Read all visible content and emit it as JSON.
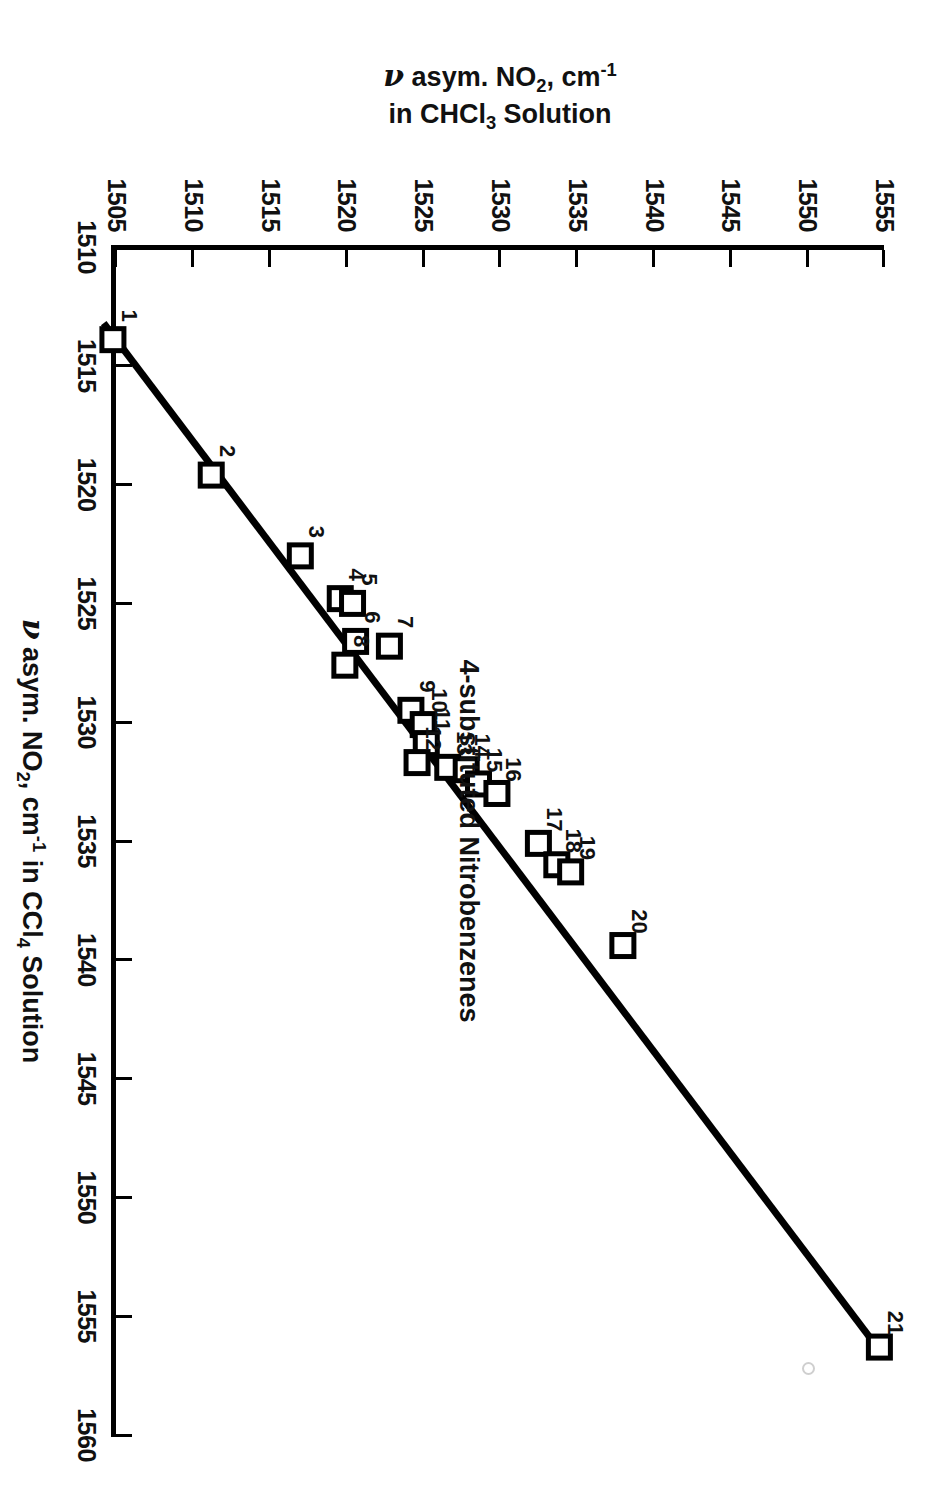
{
  "figure": {
    "annotation": "4-substituted Nitrobenzenes",
    "x_title_pre": "asym. NO",
    "x_title_sub": "2",
    "x_title_mid": ", cm",
    "x_title_sup": "-1",
    "x_title_post": " in CCl",
    "x_title_sub2": "4",
    "x_title_end": " Solution",
    "y_title_line1_pre": "asym. NO",
    "y_title_line1_sub": "2",
    "y_title_line1_mid": ", cm",
    "y_title_line1_sup": "-1",
    "y_title_line2_pre": "in CHCl",
    "y_title_line2_sub": "3",
    "y_title_line2_post": " Solution",
    "nu_glyph": "ν"
  },
  "chart_data": {
    "type": "scatter",
    "title": "",
    "annotation": "4-substituted Nitrobenzenes",
    "xlabel": "ν asym. NO2, cm-1 in CCl4 Solution",
    "ylabel": "ν asym. NO2, cm-1 in CHCl3 Solution",
    "xlim": [
      1510,
      1560
    ],
    "ylim": [
      1505,
      1555
    ],
    "xticks": [
      1510,
      1515,
      1520,
      1525,
      1530,
      1535,
      1540,
      1545,
      1550,
      1555,
      1560
    ],
    "yticks": [
      1505,
      1510,
      1515,
      1520,
      1525,
      1530,
      1535,
      1540,
      1545,
      1550,
      1555
    ],
    "grid": false,
    "legend": "none",
    "marker": "open-square",
    "fit_line": {
      "shown": true,
      "x_start": 1513.2,
      "y_start": 1504.2,
      "x_end": 1556.6,
      "y_end": 1554.9
    },
    "points": [
      {
        "label": "1",
        "x": 1513.9,
        "y": 1504.8
      },
      {
        "label": "2",
        "x": 1519.6,
        "y": 1511.2
      },
      {
        "label": "3",
        "x": 1523.0,
        "y": 1517.0
      },
      {
        "label": "4",
        "x": 1524.8,
        "y": 1519.6
      },
      {
        "label": "5",
        "x": 1525.0,
        "y": 1520.4
      },
      {
        "label": "6",
        "x": 1526.6,
        "y": 1520.6
      },
      {
        "label": "7",
        "x": 1526.8,
        "y": 1522.8
      },
      {
        "label": "8",
        "x": 1527.6,
        "y": 1519.9
      },
      {
        "label": "9",
        "x": 1529.5,
        "y": 1524.2
      },
      {
        "label": "10",
        "x": 1530.1,
        "y": 1525.0
      },
      {
        "label": "11",
        "x": 1530.9,
        "y": 1525.2
      },
      {
        "label": "12",
        "x": 1531.7,
        "y": 1524.6
      },
      {
        "label": "13",
        "x": 1531.9,
        "y": 1526.6
      },
      {
        "label": "14",
        "x": 1532.0,
        "y": 1527.8
      },
      {
        "label": "15",
        "x": 1532.6,
        "y": 1528.6
      },
      {
        "label": "16",
        "x": 1533.0,
        "y": 1529.8
      },
      {
        "label": "17",
        "x": 1535.1,
        "y": 1532.5
      },
      {
        "label": "18",
        "x": 1536.0,
        "y": 1533.7
      },
      {
        "label": "19",
        "x": 1536.3,
        "y": 1534.6
      },
      {
        "label": "20",
        "x": 1539.4,
        "y": 1538.0
      },
      {
        "label": "21",
        "x": 1556.3,
        "y": 1554.7
      }
    ]
  }
}
